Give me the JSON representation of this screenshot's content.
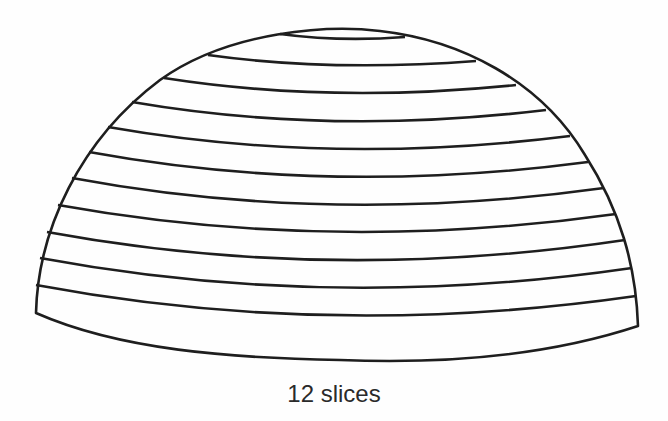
{
  "diagram": {
    "caption": "12 slices",
    "slice_count": 12,
    "stroke_color": "#1e1e1e",
    "background": "#fefefe",
    "outline": "M36,313 C38,230 80,140 160,80 C230,30 330,25 380,31 C460,40 540,80 585,155 C620,210 636,265 638,326 C520,365 390,362 340,360 C230,358 120,350 36,313 Z",
    "slice_lines": [
      "M280,34 Q340,42 405,37",
      "M208,55 Q330,72 476,61",
      "M164,78 Q330,104 516,85",
      "M132,102 Q330,136 546,110",
      "M108,127 Q330,166 570,136",
      "M89,152 Q330,196 588,162",
      "M72,178 Q330,226 604,188",
      "M58,205 Q330,254 616,214",
      "M47,232 Q330,284 625,240",
      "M40,258 Q330,312 632,268",
      "M36,285 Q330,340 636,296"
    ]
  }
}
